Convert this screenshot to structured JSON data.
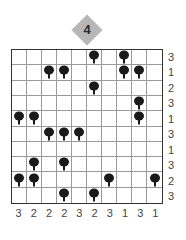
{
  "puzzle": {
    "title_badge": "4",
    "rows": 10,
    "cols": 10,
    "trees": [
      [
        0,
        5
      ],
      [
        0,
        7
      ],
      [
        1,
        2
      ],
      [
        1,
        3
      ],
      [
        1,
        7
      ],
      [
        1,
        8
      ],
      [
        2,
        5
      ],
      [
        3,
        8
      ],
      [
        4,
        0
      ],
      [
        4,
        1
      ],
      [
        4,
        8
      ],
      [
        5,
        2
      ],
      [
        5,
        3
      ],
      [
        5,
        4
      ],
      [
        7,
        1
      ],
      [
        7,
        3
      ],
      [
        8,
        0
      ],
      [
        8,
        1
      ],
      [
        8,
        6
      ],
      [
        8,
        9
      ],
      [
        9,
        3
      ],
      [
        9,
        5
      ]
    ],
    "row_clues": [
      "3",
      "1",
      "2",
      "3",
      "1",
      "3",
      "1",
      "3",
      "2",
      "3"
    ],
    "col_clues": [
      "3",
      "2",
      "2",
      "2",
      "3",
      "2",
      "3",
      "1",
      "3",
      "1"
    ],
    "colors": {
      "badge_fill": "#b7b7b7",
      "tree": "#1a1a1a",
      "grid_line": "#9a9a9a",
      "border": "#333333"
    }
  }
}
